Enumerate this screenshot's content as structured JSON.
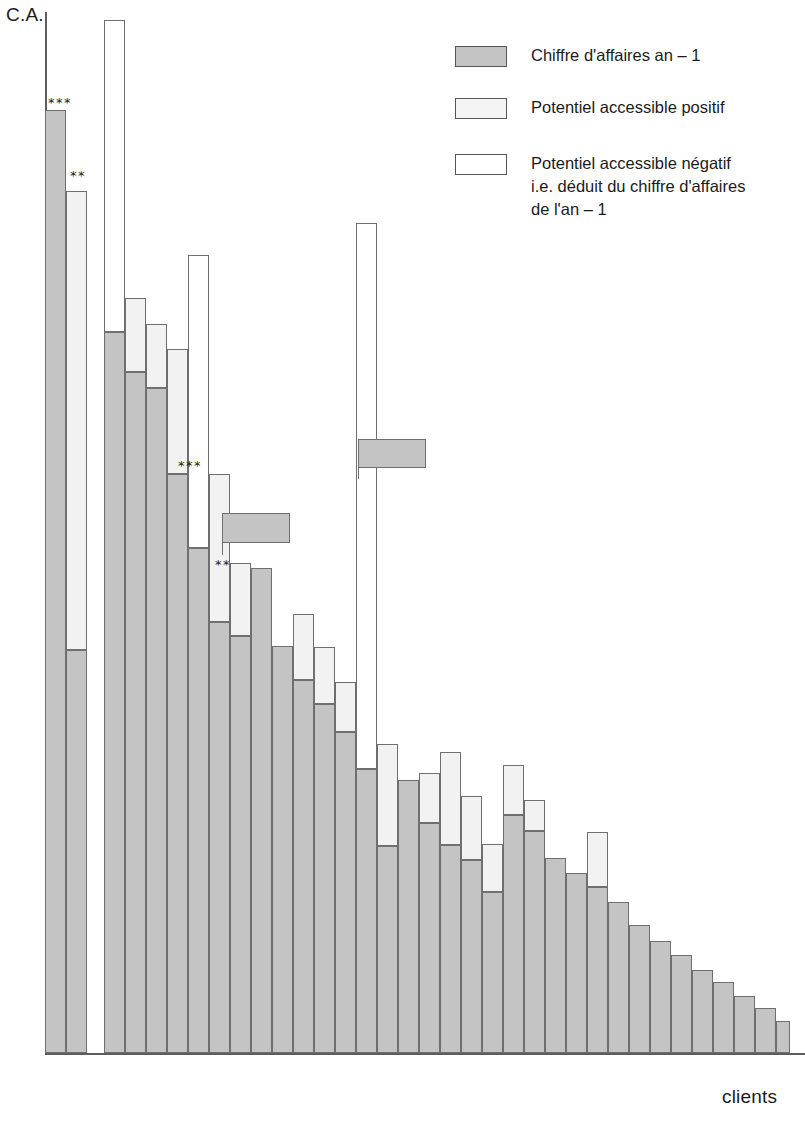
{
  "axes": {
    "y_label": "C.A.",
    "x_label": "clients"
  },
  "legend": {
    "items": [
      {
        "swatch": "ca",
        "label": "Chiffre d'affaires an – 1"
      },
      {
        "swatch": "pos",
        "label": "Potentiel accessible positif"
      },
      {
        "swatch": "neg",
        "label": "Potentiel accessible négatif\ni.e. déduit du chiffre d'affaires\nde l'an – 1"
      }
    ]
  },
  "colors": {
    "ca": "#c4c4c4",
    "positif": "#f2f2f2",
    "negatif": "#ffffff",
    "outline": "#6f6f6f",
    "axis": "#5d5d5d",
    "text": "#1b1b1b"
  },
  "chart_data": {
    "type": "bar",
    "title": "",
    "subtitle": "",
    "xlabel": "clients",
    "ylabel": "C.A.",
    "grid": false,
    "legend_position": "top-right",
    "stacking": "stacked",
    "note": "Each client bar = grey 'chiffre d'affaires an-1' base, optionally topped by a light 'potentiel accessible positif' segment, or overlaid by an open-outline 'potentiel accessible negatif' segment. Values are pixel-top readings on an unlabelled ordinal revenue axis; 0 = baseline, 100 = top of plot area.",
    "axis_pixels": {
      "baseline_y": 1053,
      "top_y": 12,
      "left_x": 45,
      "right_x": 790
    },
    "categories": [
      "c1",
      "c2",
      "c3",
      "c4",
      "c5",
      "c6",
      "c7",
      "c8",
      "c9",
      "c10",
      "c11",
      "c12",
      "c13",
      "c14",
      "c15",
      "c16",
      "c17",
      "c18",
      "c19",
      "c20",
      "c21",
      "c22",
      "c23",
      "c24",
      "c25",
      "c26",
      "c27",
      "c28",
      "c29",
      "c30",
      "c31",
      "c32",
      "c33",
      "c34",
      "c35"
    ],
    "series": [
      {
        "name": "Chiffre d'affaires an – 1",
        "key": "ca",
        "values": [
          90.6,
          38.7,
          69.3,
          65.4,
          63.9,
          55.6,
          48.5,
          41.4,
          40.1,
          46.6,
          39.1,
          35.8,
          33.5,
          30.8,
          27.3,
          19.9,
          26.2,
          22.1,
          20.0,
          18.5,
          15.5,
          22.9,
          21.3,
          18.7,
          17.3,
          15.9,
          14.5,
          12.3,
          10.8,
          9.4,
          8.0,
          6.8,
          5.5,
          4.3,
          3.1
        ]
      },
      {
        "name": "Potentiel accessible positif",
        "key": "positif",
        "values": [
          0,
          44.1,
          0,
          7.1,
          6.1,
          12.0,
          0,
          14.2,
          7.0,
          0,
          0,
          6.4,
          5.5,
          4.8,
          0,
          9.8,
          0,
          4.8,
          8.9,
          6.2,
          4.6,
          4.8,
          3.0,
          0,
          0,
          5.3,
          0,
          0,
          0,
          0,
          0,
          0,
          0,
          0,
          0
        ]
      },
      {
        "name": "Potentiel accessible négatif",
        "key": "negatif",
        "values": [
          0,
          0,
          29.9,
          0,
          0,
          0,
          28.2,
          0,
          0,
          0,
          0,
          0,
          0,
          0,
          52.4,
          0,
          0,
          0,
          0,
          0,
          0,
          0,
          0,
          0,
          0,
          0,
          0,
          0,
          0,
          0,
          0,
          0,
          0,
          0,
          0
        ]
      }
    ],
    "annotations": [
      {
        "category": "c1",
        "text": "***",
        "kind": "significance"
      },
      {
        "category": "c2",
        "text": "**",
        "kind": "significance"
      },
      {
        "category": "c8",
        "text": "***",
        "kind": "significance"
      },
      {
        "category": "c10",
        "text": "**",
        "kind": "significance"
      },
      {
        "category": "c9",
        "text": "",
        "kind": "flag",
        "note": "detached grey marker box above bar"
      },
      {
        "category": "c15",
        "text": "",
        "kind": "flag",
        "note": "detached grey marker box above tall negative bar"
      }
    ],
    "ylim": [
      0,
      100
    ]
  },
  "bars": [
    {
      "i": 0,
      "x": 45,
      "w": 21,
      "ca": 90.6,
      "pos": 0,
      "neg": 0
    },
    {
      "i": 1,
      "x": 66,
      "w": 21,
      "ca": 38.7,
      "pos": 44.1,
      "neg": 0
    },
    {
      "i": 2,
      "x": 104,
      "w": 21,
      "ca": 69.3,
      "pos": 0,
      "neg": 29.9
    },
    {
      "i": 3,
      "x": 125,
      "w": 21,
      "ca": 65.4,
      "pos": 7.1,
      "neg": 0
    },
    {
      "i": 4,
      "x": 146,
      "w": 21,
      "ca": 63.9,
      "pos": 6.1,
      "neg": 0
    },
    {
      "i": 5,
      "x": 167,
      "w": 21,
      "ca": 55.6,
      "pos": 12.0,
      "neg": 0
    },
    {
      "i": 6,
      "x": 188,
      "w": 21,
      "ca": 48.5,
      "pos": 0,
      "neg": 28.2
    },
    {
      "i": 7,
      "x": 209,
      "w": 21,
      "ca": 41.4,
      "pos": 14.2,
      "neg": 0
    },
    {
      "i": 8,
      "x": 230,
      "w": 21,
      "ca": 40.1,
      "pos": 7.0,
      "neg": 0
    },
    {
      "i": 9,
      "x": 251,
      "w": 21,
      "ca": 46.6,
      "pos": 0,
      "neg": 0
    },
    {
      "i": 10,
      "x": 272,
      "w": 21,
      "ca": 39.1,
      "pos": 0,
      "neg": 0
    },
    {
      "i": 11,
      "x": 293,
      "w": 21,
      "ca": 35.8,
      "pos": 6.4,
      "neg": 0
    },
    {
      "i": 12,
      "x": 314,
      "w": 21,
      "ca": 33.5,
      "pos": 5.5,
      "neg": 0
    },
    {
      "i": 13,
      "x": 335,
      "w": 21,
      "ca": 30.8,
      "pos": 4.8,
      "neg": 0
    },
    {
      "i": 14,
      "x": 356,
      "w": 21,
      "ca": 27.3,
      "pos": 0,
      "neg": 52.4
    },
    {
      "i": 15,
      "x": 377,
      "w": 21,
      "ca": 19.9,
      "pos": 9.8,
      "neg": 0
    },
    {
      "i": 16,
      "x": 398,
      "w": 21,
      "ca": 26.2,
      "pos": 0,
      "neg": 0
    },
    {
      "i": 17,
      "x": 419,
      "w": 21,
      "ca": 22.1,
      "pos": 4.8,
      "neg": 0
    },
    {
      "i": 18,
      "x": 440,
      "w": 21,
      "ca": 20.0,
      "pos": 8.9,
      "neg": 0
    },
    {
      "i": 19,
      "x": 461,
      "w": 21,
      "ca": 18.5,
      "pos": 6.2,
      "neg": 0
    },
    {
      "i": 20,
      "x": 482,
      "w": 21,
      "ca": 15.5,
      "pos": 4.6,
      "neg": 0
    },
    {
      "i": 21,
      "x": 503,
      "w": 21,
      "ca": 22.9,
      "pos": 4.8,
      "neg": 0
    },
    {
      "i": 22,
      "x": 524,
      "w": 21,
      "ca": 21.3,
      "pos": 3.0,
      "neg": 0
    },
    {
      "i": 23,
      "x": 545,
      "w": 21,
      "ca": 18.7,
      "pos": 0,
      "neg": 0
    },
    {
      "i": 24,
      "x": 566,
      "w": 21,
      "ca": 17.3,
      "pos": 0,
      "neg": 0
    },
    {
      "i": 25,
      "x": 587,
      "w": 21,
      "ca": 15.9,
      "pos": 5.3,
      "neg": 0
    },
    {
      "i": 26,
      "x": 608,
      "w": 21,
      "ca": 14.5,
      "pos": 0,
      "neg": 0
    },
    {
      "i": 27,
      "x": 629,
      "w": 21,
      "ca": 12.3,
      "pos": 0,
      "neg": 0
    },
    {
      "i": 28,
      "x": 650,
      "w": 21,
      "ca": 10.8,
      "pos": 0,
      "neg": 0
    },
    {
      "i": 29,
      "x": 671,
      "w": 21,
      "ca": 9.4,
      "pos": 0,
      "neg": 0
    },
    {
      "i": 30,
      "x": 692,
      "w": 21,
      "ca": 8.0,
      "pos": 0,
      "neg": 0
    },
    {
      "i": 31,
      "x": 713,
      "w": 21,
      "ca": 6.8,
      "pos": 0,
      "neg": 0
    },
    {
      "i": 32,
      "x": 734,
      "w": 21,
      "ca": 5.5,
      "pos": 0,
      "neg": 0
    },
    {
      "i": 33,
      "x": 755,
      "w": 21,
      "ca": 4.3,
      "pos": 0,
      "neg": 0
    },
    {
      "i": 34,
      "x": 776,
      "w": 14,
      "ca": 3.1,
      "pos": 0,
      "neg": 0
    }
  ],
  "stars": [
    {
      "text": "***",
      "x": 48,
      "y": 96
    },
    {
      "text": "**",
      "x": 70,
      "y": 169
    },
    {
      "text": "***",
      "x": 178,
      "y": 459
    },
    {
      "text": "**",
      "x": 215,
      "y": 558
    }
  ],
  "flags": [
    {
      "box_x": 222,
      "box_y": 513,
      "box_w": 68,
      "box_h": 30,
      "stem_x": 222,
      "stem_y": 543,
      "stem_h": 12
    },
    {
      "box_x": 358,
      "box_y": 439,
      "box_w": 68,
      "box_h": 29,
      "stem_x": 358,
      "stem_y": 468,
      "stem_h": 11
    }
  ],
  "legend_layout": {
    "rows": [
      {
        "top": 44,
        "left": 455
      },
      {
        "top": 96,
        "left": 455
      },
      {
        "top": 152,
        "left": 455
      }
    ]
  }
}
